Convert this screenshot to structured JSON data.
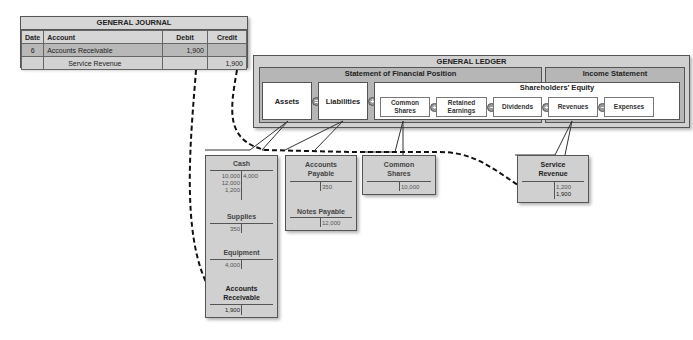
{
  "journal": {
    "title": "GENERAL JOURNAL",
    "headers": [
      "Date",
      "Account",
      "Debit",
      "Credit"
    ],
    "rows": [
      {
        "date": "6",
        "account": "Accounts Receivable",
        "debit": "1,900",
        "credit": ""
      },
      {
        "date": "",
        "account": "Service Revenue",
        "debit": "",
        "credit": "1,900"
      }
    ]
  },
  "ledger": {
    "title": "GENERAL LEDGER",
    "sfp_title": "Statement of Financial Position",
    "is_title": "Income Statement",
    "assets": "Assets",
    "liabilities": "Liabilities",
    "equity_title": "Shareholders’ Equity",
    "common_shares": "Common Shares",
    "retained_earnings": "Retained Earnings",
    "dividends": "Dividends",
    "revenues": "Revenues",
    "expenses": "Expenses",
    "ops": {
      "equals": "=",
      "plus": "+",
      "minus": "−"
    }
  },
  "taccounts": {
    "cash": {
      "name": "Cash",
      "debits": [
        "10,000",
        "12,000",
        "1,200"
      ],
      "credits": [
        "4,000"
      ]
    },
    "supplies": {
      "name": "Supplies",
      "debits": [
        "350"
      ],
      "credits": []
    },
    "equipment": {
      "name": "Equipment",
      "debits": [
        "4,000"
      ],
      "credits": []
    },
    "ar": {
      "name": "Accounts Receivable",
      "debits": [
        "1,900"
      ],
      "credits": []
    },
    "ap": {
      "name": "Accounts Payable",
      "debits": [],
      "credits": [
        "350"
      ]
    },
    "np": {
      "name": "Notes Payable",
      "debits": [],
      "credits": [
        "12,000"
      ]
    },
    "cs": {
      "name": "Common Shares",
      "debits": [],
      "credits": [
        "10,000"
      ]
    },
    "sr": {
      "name": "Service Revenue",
      "debits": [],
      "credits": [
        "1,200",
        "1,900"
      ]
    }
  }
}
